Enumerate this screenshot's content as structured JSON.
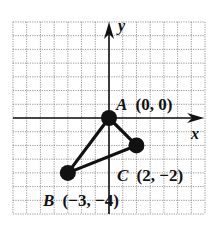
{
  "diagram": {
    "type": "coordinate-plane-triangle",
    "grid": {
      "x_min": -7,
      "x_max": 7,
      "y_min": -7,
      "y_max": 7,
      "step": 1,
      "line_style": "dotted",
      "line_color": "#8a8a8a"
    },
    "axes": {
      "x_label": "x",
      "y_label": "y",
      "color": "#111111"
    },
    "points": [
      {
        "name": "A",
        "x": 0,
        "y": 0,
        "coords_text": "(0, 0)"
      },
      {
        "name": "B",
        "x": -3,
        "y": -4,
        "coords_text": "(−3, −4)"
      },
      {
        "name": "C",
        "x": 2,
        "y": -2,
        "coords_text": "(2, −2)"
      }
    ],
    "segments": [
      [
        "A",
        "B"
      ],
      [
        "B",
        "C"
      ],
      [
        "C",
        "A"
      ]
    ],
    "colors": {
      "ink": "#111111",
      "grid": "#8a8a8a",
      "background": "#ffffff"
    }
  }
}
